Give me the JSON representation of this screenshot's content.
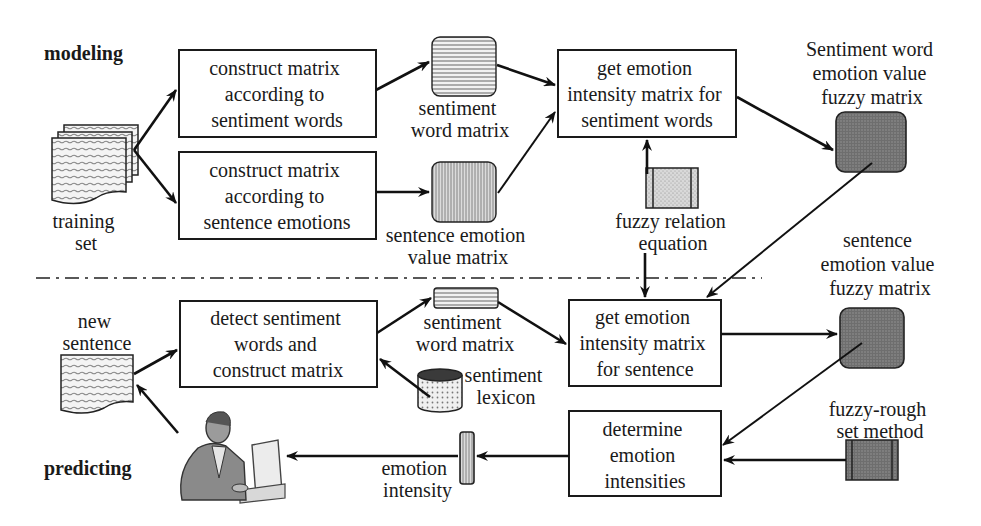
{
  "sections": {
    "modeling": "modeling",
    "predicting": "predicting"
  },
  "modeling": {
    "training_set": [
      "training",
      "set"
    ],
    "box_words": [
      "construct matrix",
      "according to",
      "sentiment words"
    ],
    "box_emotions": [
      "construct matrix",
      "according to",
      "sentence emotions"
    ],
    "sentiment_word_matrix": [
      "sentiment",
      "word matrix"
    ],
    "sentence_emotion_value_matrix": [
      "sentence emotion",
      "value matrix"
    ],
    "box_intensity_words": [
      "get emotion",
      "intensity matrix for",
      "sentiment words"
    ],
    "fuzzy_relation": [
      "fuzzy relation",
      "equation"
    ],
    "sw_fuzzy_matrix": [
      "Sentiment word",
      "emotion value",
      "fuzzy matrix"
    ]
  },
  "predicting": {
    "new_sentence": [
      "new",
      "sentence"
    ],
    "box_detect": [
      "detect sentiment",
      "words and",
      "construct matrix"
    ],
    "sentiment_word_matrix": [
      "sentiment",
      "word matrix"
    ],
    "sentiment_lexicon": [
      "sentiment",
      "lexicon"
    ],
    "box_intensity_sentence": [
      "get emotion",
      "intensity matrix",
      "for sentence"
    ],
    "se_fuzzy_matrix": [
      "sentence",
      "emotion value",
      "fuzzy matrix"
    ],
    "fuzzy_rough": [
      "fuzzy-rough",
      "set method"
    ],
    "box_determine": [
      "determine",
      "emotion",
      "intensities"
    ],
    "emotion_intensity": [
      "emotion",
      "intensity"
    ]
  }
}
